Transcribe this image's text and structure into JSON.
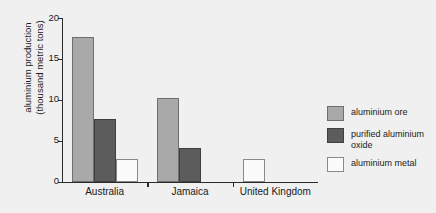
{
  "chart_data": {
    "type": "bar",
    "title": "",
    "xlabel": "",
    "ylabel": "aluminium production\n(thousand metric tons)",
    "categories": [
      "Australia",
      "Jamaica",
      "United Kingdom"
    ],
    "series": [
      {
        "name": "aluminium ore",
        "color": "#a9a9a9",
        "values": [
          17.7,
          10.2,
          0
        ]
      },
      {
        "name": "purified aluminium\noxide",
        "color": "#5c5c5c",
        "values": [
          7.6,
          4.1,
          0
        ]
      },
      {
        "name": "aluminium metal",
        "color": "#fbfbfb",
        "values": [
          2.8,
          0,
          2.8
        ]
      }
    ],
    "ylim": [
      0,
      20
    ],
    "yticks": [
      0,
      5,
      10,
      15,
      20
    ],
    "ytick_labels": [
      "0",
      "5",
      "10",
      "15",
      "20"
    ],
    "grid": false,
    "legend_position": "right"
  },
  "colors": {
    "background": "#f0f0f0",
    "axis": "#2b2b2b",
    "ore": "#a9a9a9",
    "oxide": "#5c5c5c",
    "metal": "#fbfbfb"
  }
}
